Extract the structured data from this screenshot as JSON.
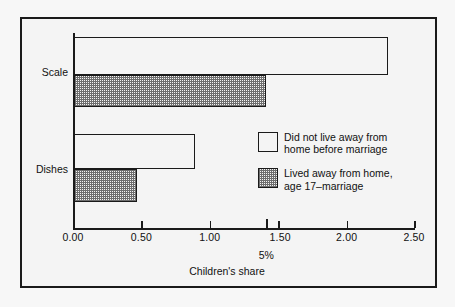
{
  "chart_data": {
    "type": "bar",
    "orientation": "horizontal",
    "title": "",
    "xlabel": "Children's share",
    "ylabel": "",
    "xlim": [
      0.0,
      2.5
    ],
    "xticks": [
      "0.00",
      "0.50",
      "1.00",
      "1.50",
      "2.00",
      "2.50"
    ],
    "xtick_values": [
      0.0,
      0.5,
      1.0,
      1.5,
      2.0,
      2.5
    ],
    "categories": [
      "Scale",
      "Dishes"
    ],
    "grid": false,
    "legend_position": "center-right",
    "series": [
      {
        "name": "Did not live away from\nhome before marriage",
        "style": "open",
        "values": [
          2.3,
          0.89
        ]
      },
      {
        "name": "Lived away from home,\nage 17–marriage",
        "style": "hatched",
        "values": [
          1.41,
          0.46
        ]
      }
    ],
    "annotations": [
      {
        "label": "5%",
        "x_value": 1.41,
        "axis": "x"
      }
    ]
  },
  "axis": {
    "x_title": "Children's share",
    "tick_labels": [
      "0.00",
      "0.50",
      "1.00",
      "1.50",
      "2.00",
      "2.50"
    ],
    "annotation_5pct": "5%"
  },
  "categories": {
    "scale": "Scale",
    "dishes": "Dishes"
  },
  "legend": {
    "items": [
      {
        "label": "Did not live away from\nhome before marriage",
        "style": "open"
      },
      {
        "label": "Lived away from home,\nage 17–marriage",
        "style": "hatched"
      }
    ]
  },
  "colors": {
    "ink": "#1a1a1a",
    "background": "#f4f4f4",
    "hatch": "#6e6e6e"
  }
}
